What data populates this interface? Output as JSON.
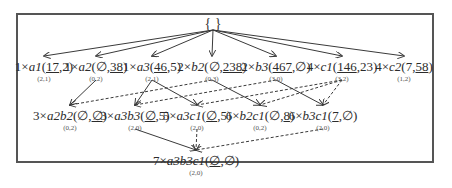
{
  "diagram": {
    "root": {
      "label": "{ }"
    },
    "level1": [
      {
        "id": "a1",
        "mult": "1×",
        "name": "a1",
        "pair": [
          "17",
          "2"
        ],
        "underline": [
          true,
          false
        ],
        "sub": "(2,1)"
      },
      {
        "id": "a2",
        "mult": "1×",
        "name": "a2",
        "pair": [
          "∅",
          "38"
        ],
        "underline": [
          false,
          true
        ],
        "sub": "(0,2)"
      },
      {
        "id": "a3",
        "mult": "1×",
        "name": "a3",
        "pair": [
          "46",
          "5"
        ],
        "underline": [
          true,
          false
        ],
        "sub": "(2,1)"
      },
      {
        "id": "b2",
        "mult": "2×",
        "name": "b2",
        "pair": [
          "∅",
          "238"
        ],
        "underline": [
          false,
          true
        ],
        "sub": "(0,3)"
      },
      {
        "id": "b3",
        "mult": "2×",
        "name": "b3",
        "pair": [
          "467",
          "∅"
        ],
        "underline": [
          true,
          false
        ],
        "sub": "(3,0)"
      },
      {
        "id": "c1",
        "mult": "4×",
        "name": "c1",
        "pair": [
          "146",
          "23"
        ],
        "underline": [
          true,
          false
        ],
        "sub": "(3,2)"
      },
      {
        "id": "c2",
        "mult": "4×",
        "name": "c2",
        "pair": [
          "7",
          "58"
        ],
        "underline": [
          false,
          true
        ],
        "sub": "(1,2)"
      }
    ],
    "level2": [
      {
        "id": "a2b2",
        "mult": "3×",
        "name": "a2b2",
        "pair": [
          "∅",
          "∅"
        ],
        "underline": [
          false,
          true
        ],
        "sub": "(0,2)"
      },
      {
        "id": "a3b3",
        "mult": "3×",
        "name": "a3b3",
        "pair": [
          "∅",
          "5"
        ],
        "underline": [
          true,
          false
        ],
        "sub": "(2,0)"
      },
      {
        "id": "a3c1",
        "mult": "5×",
        "name": "a3c1",
        "pair": [
          "∅",
          "5"
        ],
        "underline": [
          true,
          false
        ],
        "sub": "(2,0)"
      },
      {
        "id": "b2c1",
        "mult": "6×",
        "name": "b2c1",
        "pair": [
          "∅",
          "8"
        ],
        "underline": [
          false,
          true
        ],
        "sub": "(0,2)"
      },
      {
        "id": "b3c1",
        "mult": "6×",
        "name": "b3c1",
        "pair": [
          "7",
          "∅"
        ],
        "underline": [
          true,
          false
        ],
        "sub": "(2,0)"
      }
    ],
    "level3": [
      {
        "id": "a3b3c1",
        "mult": "7×",
        "name": "a3b3c1",
        "pair": [
          "∅",
          "∅"
        ],
        "underline": [
          true,
          false
        ],
        "sub": "(2,0)"
      }
    ],
    "edges_solid": [
      [
        "root",
        "a1"
      ],
      [
        "root",
        "a2"
      ],
      [
        "root",
        "a3"
      ],
      [
        "root",
        "b2"
      ],
      [
        "root",
        "b3"
      ],
      [
        "root",
        "c1"
      ],
      [
        "root",
        "c2"
      ],
      [
        "a2",
        "a2b2"
      ],
      [
        "a3",
        "a3b3"
      ],
      [
        "a3",
        "a3c1"
      ],
      [
        "b2",
        "b2c1"
      ],
      [
        "b3",
        "b3c1"
      ],
      [
        "a3b3",
        "a3b3c1"
      ]
    ],
    "edges_dashed": [
      [
        "b2",
        "a2b2"
      ],
      [
        "b3",
        "a3b3"
      ],
      [
        "c1",
        "a3c1"
      ],
      [
        "c1",
        "b2c1"
      ],
      [
        "c1",
        "b3c1"
      ],
      [
        "a3c1",
        "a3b3c1"
      ],
      [
        "b3c1",
        "a3b3c1"
      ]
    ],
    "colors": {
      "line": "#3a3a3a",
      "frame": "#555555",
      "text": "#2b2b2b"
    }
  }
}
